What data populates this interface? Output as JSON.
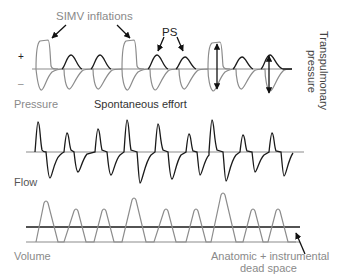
{
  "labels": {
    "simv": "SIMV inflations",
    "ps": "PS",
    "plus": "+",
    "minus": "–",
    "pressure": "Pressure",
    "spontaneous": "Spontaneous effort",
    "transpulmonary_1": "Transpulmonary",
    "transpulmonary_2": "pressure",
    "flow": "Flow",
    "volume": "Volume",
    "dead_space_1": "Anatomic + instrumental",
    "dead_space_2": "dead space"
  },
  "colors": {
    "light_trace": "#8c8c8c",
    "dark_trace": "#1a1a1a",
    "baseline": "#8c8c8c"
  }
}
